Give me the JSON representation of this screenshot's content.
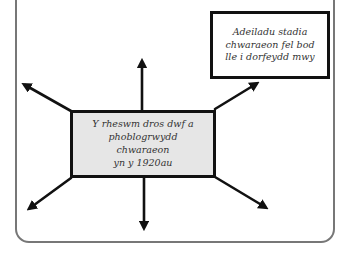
{
  "diagram": {
    "type": "spider-diagram",
    "center_box": {
      "lines": [
        "Y rheswm dros dwf a",
        "phoblogrwydd chwaraeon",
        "yn y 1920au"
      ],
      "background": "#e6e6e6"
    },
    "example_box": {
      "lines": [
        "Adeiladu stadia",
        "chwaraeon fel bod",
        "lle i dorfeydd mwy"
      ],
      "background": "#ffffff"
    },
    "arrows": [
      {
        "direction": "up-left"
      },
      {
        "direction": "up"
      },
      {
        "direction": "up-right"
      },
      {
        "direction": "down-left"
      },
      {
        "direction": "down"
      },
      {
        "direction": "down-right"
      }
    ],
    "colors": {
      "stroke": "#111111",
      "frame": "#777777",
      "text": "#333333"
    }
  }
}
